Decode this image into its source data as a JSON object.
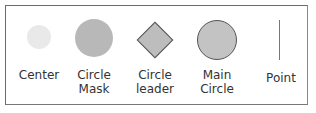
{
  "legend": {
    "items": [
      {
        "name": "center",
        "label": "Center",
        "shape": "small-circle",
        "color": "#e8e8e8"
      },
      {
        "name": "circle-mask",
        "label": "Circle\nMask",
        "shape": "circle",
        "color": "#b9b9b9"
      },
      {
        "name": "circle-leader",
        "label": "Circle\nleader",
        "shape": "diamond",
        "color": "#bdbdbd"
      },
      {
        "name": "main-circle",
        "label": "Main\nCircle",
        "shape": "outlined-circle",
        "color": "#c2c2c2"
      },
      {
        "name": "point",
        "label": "Point",
        "shape": "vertical-line",
        "color": "#777777"
      }
    ]
  }
}
